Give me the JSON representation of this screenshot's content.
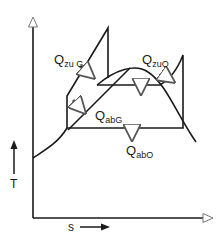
{
  "diagram": {
    "type": "T-s diagram",
    "axes": {
      "y_label": "T",
      "x_label": "s"
    },
    "labels": {
      "q_zu_g": {
        "main": "Q",
        "sub": "zu G"
      },
      "q_ab_g": {
        "main": "Q",
        "sub": "abG"
      },
      "q_zu_o": {
        "main": "Q",
        "sub": "zuO"
      },
      "q_ab_o": {
        "main": "Q",
        "sub": "abO"
      }
    },
    "colors": {
      "line": "#1a1a1a",
      "background": "#ffffff"
    }
  }
}
